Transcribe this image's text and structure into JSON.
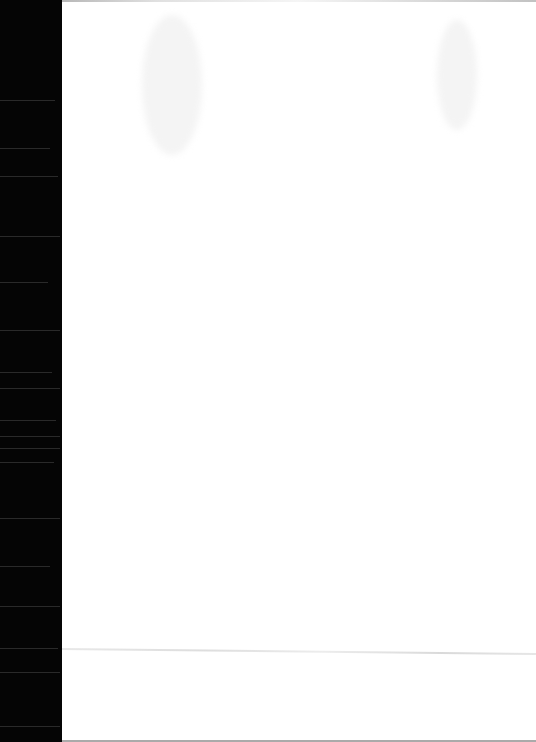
{
  "document": {
    "type": "scanned-page",
    "content": "",
    "colors": {
      "page": "#ffffff",
      "scan_edge": "#050505",
      "fold_line": "#d8d8d8"
    }
  }
}
